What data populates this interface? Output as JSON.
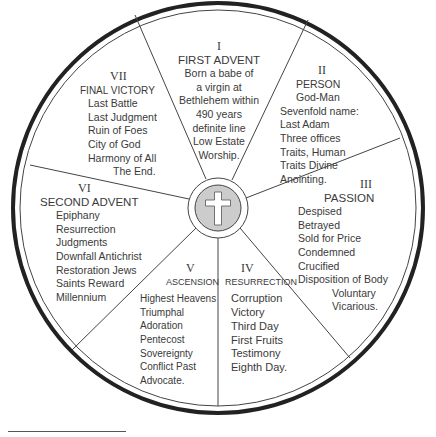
{
  "diagram": {
    "type": "wheel",
    "center_symbol": "cross-icon",
    "colors": {
      "line": "#333333",
      "hub_fill": "#cccccc",
      "cross": "#ffffff"
    },
    "segments": [
      {
        "numeral": "I",
        "title": "FIRST ADVENT",
        "items": [
          "Born a babe of",
          "a virgin at",
          "Bethlehem within",
          "490 years",
          "definite line",
          "Low Estate",
          "Worship."
        ]
      },
      {
        "numeral": "II",
        "title": "PERSON",
        "items": [
          "God-Man",
          "Sevenfold name:",
          "Last Adam",
          "Three offices",
          "Traits, Human",
          "Traits Divine",
          "Anointing."
        ]
      },
      {
        "numeral": "III",
        "title": "PASSION",
        "items": [
          "Despised",
          "Betrayed",
          "Sold for Price",
          "Condemned",
          "Crucified",
          "Disposition of Body",
          "Voluntary",
          "Vicarious."
        ]
      },
      {
        "numeral": "IV",
        "title": "RESURRECTION",
        "items": [
          "Corruption",
          "Victory",
          "Third Day",
          "First Fruits",
          "Testimony",
          "Eighth Day."
        ]
      },
      {
        "numeral": "V",
        "title": "ASCENSION",
        "items": [
          "Highest Heavens",
          "Triumphal",
          "Adoration",
          "Pentecost",
          "Sovereignty",
          "Conflict Past",
          "Advocate."
        ]
      },
      {
        "numeral": "VI",
        "title": "SECOND ADVENT",
        "items": [
          "Epiphany",
          "Resurrection",
          "Judgments",
          "Downfall Antichrist",
          "Restoration Jews",
          "Saints Reward",
          "Millennium"
        ]
      },
      {
        "numeral": "VII",
        "title": "FINAL VICTORY",
        "items": [
          "Last Battle",
          "Last Judgment",
          "Ruin of Foes",
          "City of God",
          "Harmony of All",
          "The End."
        ]
      }
    ]
  }
}
